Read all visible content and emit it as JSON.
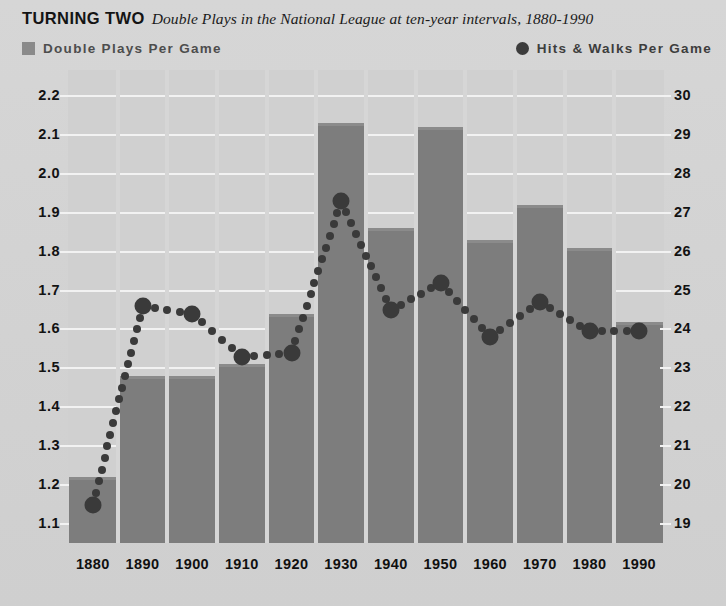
{
  "title": {
    "main": "TURNING TWO",
    "subtitle": "Double Plays in the National League at ten-year intervals, 1880-1990"
  },
  "legend": {
    "left": {
      "label": "Double Plays Per Game",
      "marker": "square-swatch",
      "color": "#8a8a8a"
    },
    "right": {
      "label": "Hits & Walks Per Game",
      "marker": "circle-swatch",
      "color": "#3c3c3c"
    }
  },
  "colors": {
    "background": "#d3d3d3",
    "plot_background": "#d0d0d0",
    "bar": "#7d7d7d",
    "dot": "#3a3a3a",
    "gridline": "#f4f4f4",
    "text": "#121212"
  },
  "chart_data": {
    "type": "bar",
    "title": "TURNING TWO",
    "subtitle": "Double Plays in the National League at ten-year intervals, 1880-1990",
    "xlabel": "",
    "grid": true,
    "legend_position": "top",
    "categories": [
      "1880",
      "1890",
      "1900",
      "1910",
      "1920",
      "1930",
      "1940",
      "1950",
      "1960",
      "1970",
      "1980",
      "1990"
    ],
    "series": [
      {
        "name": "Double Plays Per Game",
        "type": "bar",
        "axis": "left",
        "color": "#7d7d7d",
        "values": [
          1.22,
          1.48,
          1.48,
          1.51,
          1.64,
          2.13,
          1.86,
          2.12,
          1.83,
          1.92,
          1.81,
          1.62
        ]
      },
      {
        "name": "Hits & Walks Per Game",
        "type": "scatter",
        "axis": "right",
        "color": "#3a3a3a",
        "values": [
          19.5,
          24.6,
          24.4,
          23.3,
          23.4,
          27.3,
          24.5,
          25.2,
          23.8,
          24.7,
          23.95,
          23.95
        ]
      }
    ],
    "left_axis": {
      "label": "Double Plays Per Game",
      "ylim": [
        1.1,
        2.2
      ],
      "ticks": [
        "2.2",
        "2.1",
        "2.0",
        "1.9",
        "1.8",
        "1.7",
        "1.6",
        "1.5",
        "1.4",
        "1.3",
        "1.2",
        "1.1"
      ]
    },
    "right_axis": {
      "label": "Hits & Walks Per Game",
      "ylim": [
        19,
        30
      ],
      "ticks": [
        "30",
        "29",
        "28",
        "27",
        "26",
        "25",
        "24",
        "23",
        "22",
        "21",
        "20",
        "19"
      ]
    }
  }
}
